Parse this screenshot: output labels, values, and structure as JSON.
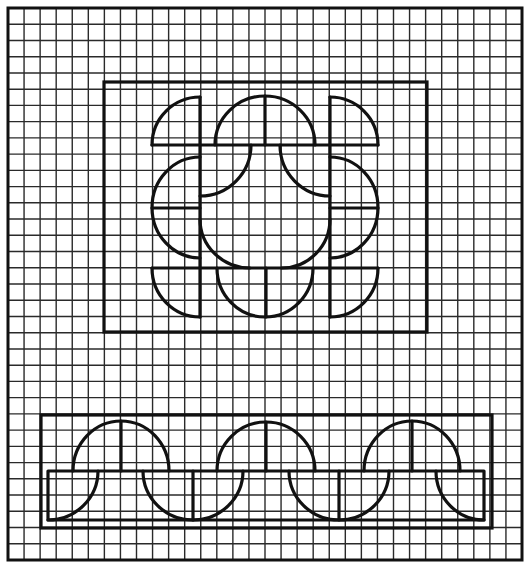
{
  "figure": {
    "width": 531,
    "height": 566,
    "background": "#ffffff",
    "line_color": "#111111",
    "grid_color": "#2a2a2a"
  },
  "grid": {
    "left": 8,
    "top": 8,
    "right": 522,
    "bottom": 560,
    "columns": 32,
    "rows": 34
  },
  "upper_design": {
    "frame": {
      "x": 104,
      "y": 82,
      "width": 323,
      "height": 250
    },
    "top_row": {
      "baseline_y": 145,
      "left_quarter": {
        "x_start": 152,
        "x_end": 200,
        "top_y": 97
      },
      "center_half": {
        "x_start": 215,
        "x_end": 315,
        "top_y": 96,
        "divider_x": 265
      },
      "right_quarter": {
        "x_start": 330,
        "x_end": 378,
        "top_y": 97
      }
    },
    "middle_row": {
      "left_half": {
        "x": 200,
        "y_start": 157,
        "y_end": 258,
        "bulge_x": 152,
        "divider_y": 208
      },
      "right_half": {
        "x": 330,
        "y_start": 157,
        "y_end": 258,
        "bulge_x": 378,
        "divider_y": 208
      },
      "concave_arcs": [
        {
          "from": [
            251,
            145
          ],
          "to": [
            200,
            196
          ]
        },
        {
          "from": [
            280,
            145
          ],
          "to": [
            330,
            196
          ]
        },
        {
          "from": [
            200,
            219
          ],
          "to": [
            250,
            268
          ]
        },
        {
          "from": [
            330,
            219
          ],
          "to": [
            282,
            268
          ]
        }
      ]
    },
    "bottom_row": {
      "baseline_y": 268,
      "left_quarter": {
        "x_start": 152,
        "x_end": 200,
        "bottom_y": 317
      },
      "center_half": {
        "x_start": 217,
        "x_end": 313,
        "bottom_y": 317,
        "divider_x": 266
      },
      "right_quarter": {
        "x_start": 330,
        "x_end": 378,
        "bottom_y": 317
      }
    },
    "vertical_dividers": [
      {
        "x": 200,
        "y_start": 97,
        "y_end": 317
      },
      {
        "x": 330,
        "y_start": 97,
        "y_end": 317
      }
    ]
  },
  "frieze": {
    "frame": {
      "x": 41,
      "y": 415,
      "width": 451,
      "height": 113
    },
    "bar": {
      "x": 48,
      "y": 471,
      "width": 436,
      "height": 49
    },
    "bumps": [
      {
        "center_x": 121,
        "half_width": 48,
        "top_y": 421,
        "divider": true
      },
      {
        "center_x": 266,
        "half_width": 49,
        "top_y": 422,
        "divider": true
      },
      {
        "center_x": 412,
        "half_width": 48,
        "top_y": 421,
        "divider": true
      }
    ],
    "bowls": [
      {
        "center_x": 193,
        "half_width": 50,
        "bottom_y": 520,
        "divider": true
      },
      {
        "center_x": 339,
        "half_width": 50,
        "bottom_y": 520,
        "divider": true
      }
    ],
    "end_arcs": [
      {
        "from": [
          98,
          471
        ],
        "to": [
          48,
          520
        ],
        "side": "left"
      },
      {
        "from": [
          436,
          471
        ],
        "to": [
          484,
          520
        ],
        "side": "right"
      }
    ]
  }
}
